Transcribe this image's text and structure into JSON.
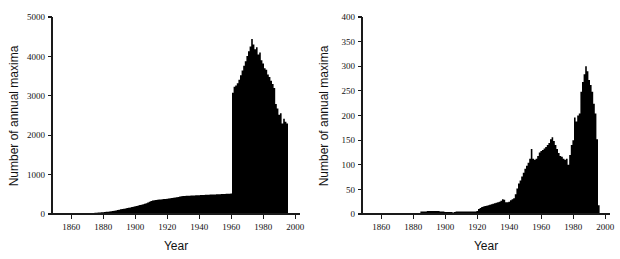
{
  "figure": {
    "background_color": "#ffffff",
    "series_color": "#000000",
    "axis_color": "#1a1a1a",
    "panel_count": 2
  },
  "chart_data": [
    {
      "id": "left-panel",
      "type": "bar",
      "title": "",
      "subtitle": "",
      "xlabel": "Year",
      "ylabel": "Number of annual maxima",
      "xlim": [
        1848,
        2003
      ],
      "ylim": [
        0,
        5000
      ],
      "xticks": [
        1860,
        1880,
        1900,
        1920,
        1940,
        1960,
        1980,
        2000
      ],
      "xticklabels": [
        "1860",
        "1880",
        "1900",
        "1920",
        "1940",
        "1960",
        "1980",
        "2000"
      ],
      "yticks": [
        0,
        1000,
        2000,
        3000,
        4000,
        5000
      ],
      "yticklabels": [
        "0",
        "1000",
        "2000",
        "3000",
        "4000",
        "5000"
      ],
      "grid": false,
      "legend": "none",
      "annotations": [],
      "x": [
        1850,
        1851,
        1852,
        1853,
        1854,
        1855,
        1856,
        1857,
        1858,
        1859,
        1860,
        1861,
        1862,
        1863,
        1864,
        1865,
        1866,
        1867,
        1868,
        1869,
        1870,
        1871,
        1872,
        1873,
        1874,
        1875,
        1876,
        1877,
        1878,
        1879,
        1880,
        1881,
        1882,
        1883,
        1884,
        1885,
        1886,
        1887,
        1888,
        1889,
        1890,
        1891,
        1892,
        1893,
        1894,
        1895,
        1896,
        1897,
        1898,
        1899,
        1900,
        1901,
        1902,
        1903,
        1904,
        1905,
        1906,
        1907,
        1908,
        1909,
        1910,
        1911,
        1912,
        1913,
        1914,
        1915,
        1916,
        1917,
        1918,
        1919,
        1920,
        1921,
        1922,
        1923,
        1924,
        1925,
        1926,
        1927,
        1928,
        1929,
        1930,
        1931,
        1932,
        1933,
        1934,
        1935,
        1936,
        1937,
        1938,
        1939,
        1940,
        1941,
        1942,
        1943,
        1944,
        1945,
        1946,
        1947,
        1948,
        1949,
        1950,
        1951,
        1952,
        1953,
        1954,
        1955,
        1956,
        1957,
        1958,
        1959,
        1960,
        1961,
        1962,
        1963,
        1964,
        1965,
        1966,
        1967,
        1968,
        1969,
        1970,
        1971,
        1972,
        1973,
        1974,
        1975,
        1976,
        1977,
        1978,
        1979,
        1980,
        1981,
        1982,
        1983,
        1984,
        1985,
        1986,
        1987,
        1988,
        1989,
        1990,
        1991,
        1992,
        1993,
        1994,
        1995,
        1996
      ],
      "values": [
        2,
        3,
        3,
        4,
        4,
        5,
        5,
        6,
        6,
        7,
        8,
        9,
        10,
        11,
        12,
        13,
        14,
        15,
        16,
        18,
        20,
        22,
        24,
        26,
        28,
        30,
        33,
        36,
        39,
        42,
        46,
        50,
        55,
        60,
        66,
        72,
        78,
        85,
        92,
        100,
        110,
        118,
        126,
        134,
        142,
        150,
        158,
        166,
        175,
        185,
        196,
        206,
        216,
        226,
        236,
        248,
        262,
        276,
        292,
        310,
        330,
        344,
        352,
        358,
        362,
        366,
        370,
        374,
        378,
        382,
        388,
        394,
        400,
        406,
        412,
        418,
        426,
        434,
        442,
        450,
        456,
        460,
        462,
        464,
        466,
        468,
        470,
        472,
        474,
        476,
        478,
        480,
        482,
        484,
        486,
        488,
        490,
        492,
        494,
        496,
        498,
        500,
        502,
        504,
        506,
        508,
        510,
        512,
        514,
        516,
        518,
        3080,
        3230,
        3260,
        3320,
        3410,
        3520,
        3640,
        3760,
        3880,
        4010,
        4130,
        4250,
        4440,
        4300,
        4180,
        4230,
        4050,
        4100,
        3900,
        3820,
        3700,
        3660,
        3540,
        3480,
        3380,
        3300,
        3200,
        2790,
        2680,
        2520,
        2560,
        2300,
        2420,
        2340,
        2300,
        0
      ]
    },
    {
      "id": "right-panel",
      "type": "bar",
      "title": "",
      "subtitle": "",
      "xlabel": "Year",
      "ylabel": "Number of annual maxima",
      "xlim": [
        1848,
        2003
      ],
      "ylim": [
        0,
        400
      ],
      "xticks": [
        1860,
        1880,
        1900,
        1920,
        1940,
        1960,
        1980,
        2000
      ],
      "xticklabels": [
        "1860",
        "1880",
        "1900",
        "1920",
        "1940",
        "1960",
        "1980",
        "2000"
      ],
      "yticks": [
        0,
        50,
        100,
        150,
        200,
        250,
        300,
        350,
        400
      ],
      "yticklabels": [
        "0",
        "50",
        "100",
        "150",
        "200",
        "250",
        "300",
        "350",
        "400"
      ],
      "grid": false,
      "legend": "none",
      "annotations": [],
      "x": [
        1850,
        1851,
        1852,
        1853,
        1854,
        1855,
        1856,
        1857,
        1858,
        1859,
        1860,
        1861,
        1862,
        1863,
        1864,
        1865,
        1866,
        1867,
        1868,
        1869,
        1870,
        1871,
        1872,
        1873,
        1874,
        1875,
        1876,
        1877,
        1878,
        1879,
        1880,
        1881,
        1882,
        1883,
        1884,
        1885,
        1886,
        1887,
        1888,
        1889,
        1890,
        1891,
        1892,
        1893,
        1894,
        1895,
        1896,
        1897,
        1898,
        1899,
        1900,
        1901,
        1902,
        1903,
        1904,
        1905,
        1906,
        1907,
        1908,
        1909,
        1910,
        1911,
        1912,
        1913,
        1914,
        1915,
        1916,
        1917,
        1918,
        1919,
        1920,
        1921,
        1922,
        1923,
        1924,
        1925,
        1926,
        1927,
        1928,
        1929,
        1930,
        1931,
        1932,
        1933,
        1934,
        1935,
        1936,
        1937,
        1938,
        1939,
        1940,
        1941,
        1942,
        1943,
        1944,
        1945,
        1946,
        1947,
        1948,
        1949,
        1950,
        1951,
        1952,
        1953,
        1954,
        1955,
        1956,
        1957,
        1958,
        1959,
        1960,
        1961,
        1962,
        1963,
        1964,
        1965,
        1966,
        1967,
        1968,
        1969,
        1970,
        1971,
        1972,
        1973,
        1974,
        1975,
        1976,
        1977,
        1978,
        1979,
        1980,
        1981,
        1982,
        1983,
        1984,
        1985,
        1986,
        1987,
        1988,
        1989,
        1990,
        1991,
        1992,
        1993,
        1994,
        1995,
        1996
      ],
      "values": [
        0,
        0,
        0,
        0,
        0,
        0,
        0,
        0,
        0,
        0,
        0,
        0,
        0,
        0,
        0,
        0,
        0,
        0,
        0,
        0,
        0,
        0,
        0,
        0,
        0,
        0,
        0,
        0,
        0,
        0,
        0,
        0,
        0,
        0,
        0,
        5,
        5,
        5,
        5,
        6,
        6,
        6,
        6,
        6,
        6,
        6,
        6,
        5,
        5,
        5,
        4,
        4,
        4,
        4,
        4,
        3,
        4,
        5,
        5,
        5,
        5,
        5,
        5,
        5,
        5,
        5,
        5,
        5,
        5,
        5,
        6,
        10,
        12,
        14,
        15,
        16,
        17,
        18,
        19,
        20,
        21,
        22,
        23,
        24,
        25,
        27,
        30,
        29,
        24,
        24,
        25,
        28,
        30,
        32,
        40,
        52,
        62,
        68,
        76,
        84,
        92,
        98,
        104,
        112,
        132,
        112,
        110,
        112,
        118,
        125,
        128,
        130,
        133,
        136,
        140,
        144,
        152,
        156,
        148,
        140,
        132,
        124,
        118,
        116,
        112,
        110,
        112,
        100,
        120,
        140,
        150,
        196,
        188,
        200,
        204,
        248,
        268,
        284,
        300,
        290,
        272,
        262,
        248,
        224,
        204,
        152,
        18
      ]
    }
  ]
}
